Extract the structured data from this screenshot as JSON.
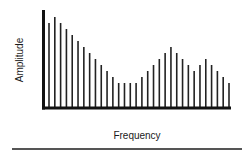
{
  "chart_data": {
    "type": "bar",
    "title": "",
    "xlabel": "Frequency",
    "ylabel": "Amplitude",
    "grid": false,
    "legend": null,
    "style": "spectrum stem plot (thin vertical lines)",
    "categories": [
      1,
      2,
      3,
      4,
      5,
      6,
      7,
      8,
      9,
      10,
      11,
      12,
      13,
      14,
      15,
      16,
      17,
      18,
      19,
      20,
      21,
      22,
      23,
      24,
      25,
      26,
      27,
      28,
      29,
      30,
      31,
      32
    ],
    "values": [
      85,
      91,
      85,
      79,
      73,
      67,
      61,
      55,
      49,
      43,
      37,
      31,
      25,
      25,
      25,
      25,
      31,
      37,
      43,
      49,
      55,
      61,
      55,
      49,
      43,
      37,
      43,
      49,
      43,
      37,
      31,
      25
    ],
    "ylim": [
      0,
      98
    ],
    "x_ticks": [],
    "y_ticks": []
  },
  "colors": {
    "bars": "#222222",
    "axes": "#111111",
    "text": "#1a1a1a",
    "rule": "#555555"
  }
}
